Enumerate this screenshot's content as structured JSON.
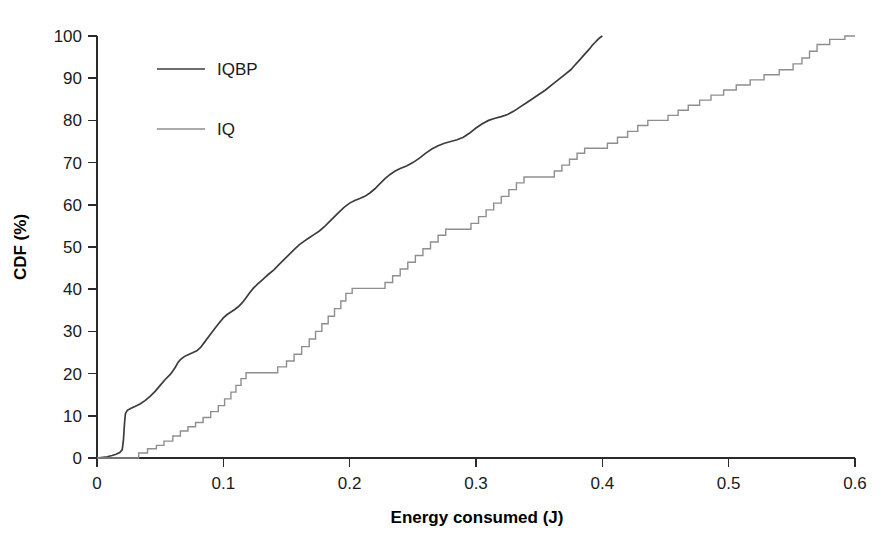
{
  "chart_data": {
    "type": "line",
    "title": "",
    "subtitle": "",
    "xlabel": "Energy consumed (J)",
    "ylabel": "CDF (%)",
    "xlim": [
      0,
      0.6
    ],
    "ylim": [
      0,
      100
    ],
    "xticks": [
      0,
      0.1,
      0.2,
      0.3,
      0.4,
      0.5,
      0.6
    ],
    "xticklabels": [
      "0",
      "0.1",
      "0.2",
      "0.3",
      "0.4",
      "0.5",
      "0.6"
    ],
    "yticks": [
      0,
      10,
      20,
      30,
      40,
      50,
      60,
      70,
      80,
      90,
      100
    ],
    "yticklabels": [
      "0",
      "10",
      "20",
      "30",
      "40",
      "50",
      "60",
      "70",
      "80",
      "90",
      "100"
    ],
    "grid": false,
    "legend_position": "upper-left-inside",
    "legend": [
      {
        "name": "IQBP",
        "color": "#3c3c3c",
        "width": 1.7
      },
      {
        "name": "IQ",
        "color": "#8e8e8e",
        "width": 1.5
      }
    ],
    "series": [
      {
        "name": "IQBP",
        "color": "#3c3c3c",
        "points": [
          [
            0.0,
            0.0
          ],
          [
            0.008,
            0.3
          ],
          [
            0.012,
            0.6
          ],
          [
            0.015,
            0.9
          ],
          [
            0.018,
            1.3
          ],
          [
            0.02,
            2.0
          ],
          [
            0.021,
            4.5
          ],
          [
            0.0215,
            7.0
          ],
          [
            0.022,
            9.0
          ],
          [
            0.0225,
            10.5
          ],
          [
            0.024,
            11.3
          ],
          [
            0.027,
            11.8
          ],
          [
            0.03,
            12.2
          ],
          [
            0.034,
            12.8
          ],
          [
            0.038,
            13.6
          ],
          [
            0.042,
            14.6
          ],
          [
            0.046,
            15.8
          ],
          [
            0.05,
            17.2
          ],
          [
            0.054,
            18.6
          ],
          [
            0.058,
            19.8
          ],
          [
            0.06,
            20.6
          ],
          [
            0.062,
            21.5
          ],
          [
            0.064,
            22.6
          ],
          [
            0.066,
            23.3
          ],
          [
            0.068,
            23.8
          ],
          [
            0.07,
            24.2
          ],
          [
            0.073,
            24.6
          ],
          [
            0.076,
            25.0
          ],
          [
            0.079,
            25.4
          ],
          [
            0.082,
            26.2
          ],
          [
            0.085,
            27.4
          ],
          [
            0.088,
            28.6
          ],
          [
            0.091,
            29.8
          ],
          [
            0.094,
            31.0
          ],
          [
            0.097,
            32.1
          ],
          [
            0.1,
            33.2
          ],
          [
            0.103,
            34.0
          ],
          [
            0.106,
            34.6
          ],
          [
            0.109,
            35.2
          ],
          [
            0.112,
            35.9
          ],
          [
            0.115,
            36.8
          ],
          [
            0.118,
            38.0
          ],
          [
            0.121,
            39.2
          ],
          [
            0.124,
            40.3
          ],
          [
            0.127,
            41.2
          ],
          [
            0.13,
            42.0
          ],
          [
            0.133,
            42.8
          ],
          [
            0.136,
            43.6
          ],
          [
            0.14,
            44.6
          ],
          [
            0.144,
            45.8
          ],
          [
            0.148,
            47.0
          ],
          [
            0.152,
            48.2
          ],
          [
            0.156,
            49.4
          ],
          [
            0.16,
            50.5
          ],
          [
            0.164,
            51.4
          ],
          [
            0.168,
            52.2
          ],
          [
            0.172,
            53.0
          ],
          [
            0.176,
            53.8
          ],
          [
            0.18,
            54.8
          ],
          [
            0.184,
            56.0
          ],
          [
            0.188,
            57.2
          ],
          [
            0.192,
            58.4
          ],
          [
            0.196,
            59.5
          ],
          [
            0.2,
            60.4
          ],
          [
            0.204,
            61.0
          ],
          [
            0.208,
            61.5
          ],
          [
            0.212,
            62.0
          ],
          [
            0.216,
            62.8
          ],
          [
            0.22,
            63.8
          ],
          [
            0.224,
            65.0
          ],
          [
            0.228,
            66.2
          ],
          [
            0.232,
            67.2
          ],
          [
            0.236,
            68.0
          ],
          [
            0.24,
            68.6
          ],
          [
            0.245,
            69.2
          ],
          [
            0.25,
            70.0
          ],
          [
            0.255,
            71.0
          ],
          [
            0.26,
            72.2
          ],
          [
            0.265,
            73.2
          ],
          [
            0.27,
            74.0
          ],
          [
            0.275,
            74.6
          ],
          [
            0.28,
            75.0
          ],
          [
            0.285,
            75.4
          ],
          [
            0.29,
            76.0
          ],
          [
            0.295,
            77.0
          ],
          [
            0.3,
            78.2
          ],
          [
            0.305,
            79.2
          ],
          [
            0.31,
            80.0
          ],
          [
            0.315,
            80.5
          ],
          [
            0.32,
            80.9
          ],
          [
            0.325,
            81.4
          ],
          [
            0.33,
            82.2
          ],
          [
            0.335,
            83.2
          ],
          [
            0.34,
            84.2
          ],
          [
            0.345,
            85.2
          ],
          [
            0.35,
            86.2
          ],
          [
            0.355,
            87.2
          ],
          [
            0.36,
            88.4
          ],
          [
            0.365,
            89.6
          ],
          [
            0.37,
            90.8
          ],
          [
            0.375,
            92.0
          ],
          [
            0.378,
            93.0
          ],
          [
            0.381,
            94.0
          ],
          [
            0.384,
            95.0
          ],
          [
            0.387,
            96.0
          ],
          [
            0.39,
            97.0
          ],
          [
            0.392,
            97.8
          ],
          [
            0.394,
            98.4
          ],
          [
            0.396,
            99.0
          ],
          [
            0.398,
            99.6
          ],
          [
            0.4,
            100.0
          ]
        ]
      },
      {
        "name": "IQ",
        "color": "#8e8e8e",
        "points": [
          [
            0.0,
            0.0
          ],
          [
            0.033,
            0.0
          ],
          [
            0.033,
            1.2
          ],
          [
            0.04,
            1.2
          ],
          [
            0.04,
            2.2
          ],
          [
            0.047,
            2.2
          ],
          [
            0.047,
            3.0
          ],
          [
            0.053,
            3.0
          ],
          [
            0.053,
            4.0
          ],
          [
            0.06,
            4.0
          ],
          [
            0.06,
            5.2
          ],
          [
            0.066,
            5.2
          ],
          [
            0.066,
            6.4
          ],
          [
            0.072,
            6.4
          ],
          [
            0.072,
            7.4
          ],
          [
            0.078,
            7.4
          ],
          [
            0.078,
            8.4
          ],
          [
            0.084,
            8.4
          ],
          [
            0.084,
            9.6
          ],
          [
            0.09,
            9.6
          ],
          [
            0.09,
            11.0
          ],
          [
            0.096,
            11.0
          ],
          [
            0.096,
            12.4
          ],
          [
            0.101,
            12.4
          ],
          [
            0.101,
            14.0
          ],
          [
            0.106,
            14.0
          ],
          [
            0.106,
            15.6
          ],
          [
            0.11,
            15.6
          ],
          [
            0.11,
            17.2
          ],
          [
            0.114,
            17.2
          ],
          [
            0.114,
            18.8
          ],
          [
            0.118,
            18.8
          ],
          [
            0.118,
            20.2
          ],
          [
            0.143,
            20.2
          ],
          [
            0.143,
            21.6
          ],
          [
            0.15,
            21.6
          ],
          [
            0.15,
            23.0
          ],
          [
            0.156,
            23.0
          ],
          [
            0.156,
            24.6
          ],
          [
            0.162,
            24.6
          ],
          [
            0.162,
            26.4
          ],
          [
            0.168,
            26.4
          ],
          [
            0.168,
            28.2
          ],
          [
            0.173,
            28.2
          ],
          [
            0.173,
            30.0
          ],
          [
            0.178,
            30.0
          ],
          [
            0.178,
            31.8
          ],
          [
            0.183,
            31.8
          ],
          [
            0.183,
            33.6
          ],
          [
            0.188,
            33.6
          ],
          [
            0.188,
            35.4
          ],
          [
            0.193,
            35.4
          ],
          [
            0.193,
            37.2
          ],
          [
            0.197,
            37.2
          ],
          [
            0.197,
            39.0
          ],
          [
            0.202,
            39.0
          ],
          [
            0.202,
            40.2
          ],
          [
            0.228,
            40.2
          ],
          [
            0.228,
            41.6
          ],
          [
            0.234,
            41.6
          ],
          [
            0.234,
            43.2
          ],
          [
            0.24,
            43.2
          ],
          [
            0.24,
            44.8
          ],
          [
            0.246,
            44.8
          ],
          [
            0.246,
            46.4
          ],
          [
            0.252,
            46.4
          ],
          [
            0.252,
            48.0
          ],
          [
            0.258,
            48.0
          ],
          [
            0.258,
            49.6
          ],
          [
            0.264,
            49.6
          ],
          [
            0.264,
            51.2
          ],
          [
            0.27,
            51.2
          ],
          [
            0.27,
            52.8
          ],
          [
            0.276,
            52.8
          ],
          [
            0.276,
            54.2
          ],
          [
            0.296,
            54.2
          ],
          [
            0.296,
            55.6
          ],
          [
            0.302,
            55.6
          ],
          [
            0.302,
            57.2
          ],
          [
            0.308,
            57.2
          ],
          [
            0.308,
            58.8
          ],
          [
            0.314,
            58.8
          ],
          [
            0.314,
            60.4
          ],
          [
            0.32,
            60.4
          ],
          [
            0.32,
            62.0
          ],
          [
            0.326,
            62.0
          ],
          [
            0.326,
            63.6
          ],
          [
            0.332,
            63.6
          ],
          [
            0.332,
            65.2
          ],
          [
            0.338,
            65.2
          ],
          [
            0.338,
            66.6
          ],
          [
            0.362,
            66.6
          ],
          [
            0.362,
            68.0
          ],
          [
            0.368,
            68.0
          ],
          [
            0.368,
            69.4
          ],
          [
            0.374,
            69.4
          ],
          [
            0.374,
            70.8
          ],
          [
            0.38,
            70.8
          ],
          [
            0.38,
            72.2
          ],
          [
            0.386,
            72.2
          ],
          [
            0.386,
            73.4
          ],
          [
            0.404,
            73.4
          ],
          [
            0.404,
            74.6
          ],
          [
            0.412,
            74.6
          ],
          [
            0.412,
            76.0
          ],
          [
            0.42,
            76.0
          ],
          [
            0.42,
            77.4
          ],
          [
            0.428,
            77.4
          ],
          [
            0.428,
            78.8
          ],
          [
            0.436,
            78.8
          ],
          [
            0.436,
            80.0
          ],
          [
            0.452,
            80.0
          ],
          [
            0.452,
            81.2
          ],
          [
            0.46,
            81.2
          ],
          [
            0.46,
            82.4
          ],
          [
            0.468,
            82.4
          ],
          [
            0.468,
            83.6
          ],
          [
            0.477,
            83.6
          ],
          [
            0.477,
            84.8
          ],
          [
            0.486,
            84.8
          ],
          [
            0.486,
            86.0
          ],
          [
            0.496,
            86.0
          ],
          [
            0.496,
            87.2
          ],
          [
            0.506,
            87.2
          ],
          [
            0.506,
            88.4
          ],
          [
            0.517,
            88.4
          ],
          [
            0.517,
            89.6
          ],
          [
            0.528,
            89.6
          ],
          [
            0.528,
            90.8
          ],
          [
            0.54,
            90.8
          ],
          [
            0.54,
            92.0
          ],
          [
            0.551,
            92.0
          ],
          [
            0.551,
            93.4
          ],
          [
            0.558,
            93.4
          ],
          [
            0.558,
            94.8
          ],
          [
            0.564,
            94.8
          ],
          [
            0.564,
            96.4
          ],
          [
            0.57,
            96.4
          ],
          [
            0.57,
            98.0
          ],
          [
            0.58,
            98.0
          ],
          [
            0.58,
            99.2
          ],
          [
            0.592,
            99.2
          ],
          [
            0.592,
            100.0
          ],
          [
            0.6,
            100.0
          ]
        ]
      }
    ]
  },
  "axes": {
    "x_axis_title": "Energy consumed (J)",
    "y_axis_title": "CDF (%)"
  }
}
